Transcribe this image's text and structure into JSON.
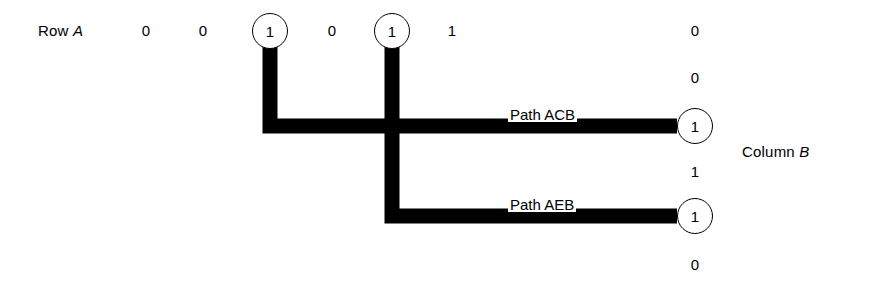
{
  "diagram": {
    "title_row": {
      "label_static": "Row",
      "label_italic": "A"
    },
    "column_label": {
      "label_static": "Column",
      "label_italic": "B"
    },
    "row_a_cells": [
      {
        "value": "0",
        "circled": false,
        "x": 146,
        "y": 31
      },
      {
        "value": "0",
        "circled": false,
        "x": 203,
        "y": 31
      },
      {
        "value": "1",
        "circled": true,
        "x": 270,
        "y": 31
      },
      {
        "value": "0",
        "circled": false,
        "x": 332,
        "y": 31
      },
      {
        "value": "1",
        "circled": true,
        "x": 392,
        "y": 31
      },
      {
        "value": "1",
        "circled": false,
        "x": 452,
        "y": 31
      }
    ],
    "column_b_cells": [
      {
        "value": "0",
        "circled": false,
        "x": 695,
        "y": 31
      },
      {
        "value": "0",
        "circled": false,
        "x": 695,
        "y": 78
      },
      {
        "value": "1",
        "circled": true,
        "x": 695,
        "y": 126
      },
      {
        "value": "1",
        "circled": false,
        "x": 695,
        "y": 172
      },
      {
        "value": "1",
        "circled": true,
        "x": 695,
        "y": 216
      },
      {
        "value": "0",
        "circled": false,
        "x": 695,
        "y": 265
      }
    ],
    "paths": [
      {
        "name": "path-acb",
        "label_static": "Path",
        "label_italic": "ACB",
        "label_x": 508,
        "label_y": 107,
        "stroke": "#000000",
        "stroke_width": 15,
        "points": "270,31 270,126 677,126"
      },
      {
        "name": "path-aeb",
        "label_static": "Path",
        "label_italic": "AEB",
        "label_x": 508,
        "label_y": 197,
        "stroke": "#000000",
        "stroke_width": 15,
        "points": "392,31 392,216 677,216"
      }
    ],
    "row_label_x": 38,
    "row_label_y": 31,
    "column_label_x": 742,
    "column_label_y": 152,
    "background": "#ffffff",
    "ink": "#000000"
  }
}
